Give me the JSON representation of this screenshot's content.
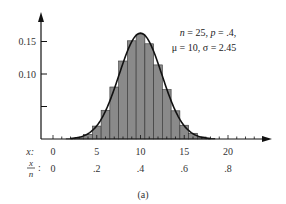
{
  "chart_data": {
    "type": "bar",
    "subtype": "histogram-with-normal-curve",
    "caption": "(a)",
    "annotation": {
      "line1": "n = 25, p = .4,",
      "line2": "μ = 10, σ = 2.45"
    },
    "params": {
      "n": 25,
      "p": 0.4,
      "mu": 10,
      "sigma": 2.45
    },
    "xlabel": "x:",
    "xlabel2": "x/n:",
    "x_ticks": [
      0,
      5,
      10,
      15,
      20
    ],
    "x_tick_labels": [
      "0",
      "5",
      "10",
      "15",
      "20"
    ],
    "x2_tick_labels": [
      "0",
      ".2",
      ".4",
      ".6",
      ".8"
    ],
    "y_ticks": [
      0.05,
      0.1,
      0.15
    ],
    "y_tick_labels": [
      "",
      "0.10",
      "0.15"
    ],
    "ylim": [
      0,
      0.19
    ],
    "xlim": [
      -1,
      25
    ],
    "grid": false,
    "categories": [
      2,
      3,
      4,
      5,
      6,
      7,
      8,
      9,
      10,
      11,
      12,
      13,
      14,
      15,
      16,
      17,
      18
    ],
    "values": [
      0.0004,
      0.0019,
      0.0071,
      0.0199,
      0.0442,
      0.08,
      0.12,
      0.1511,
      0.1612,
      0.1465,
      0.114,
      0.076,
      0.0434,
      0.0212,
      0.0088,
      0.0031,
      0.0009
    ],
    "bar_color": "#8a8a8a",
    "curve_color": "#111111"
  }
}
